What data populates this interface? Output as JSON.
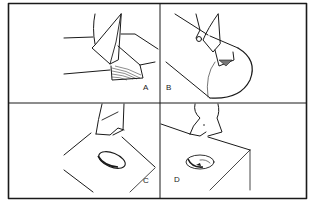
{
  "figure": {
    "panels": [
      {
        "id": "A",
        "label": "A",
        "subject": "drill bit cutting into edge of rectangular block, chip curl shown"
      },
      {
        "id": "B",
        "label": "B",
        "subject": "drill bit cutting into cylindrical rod"
      },
      {
        "id": "C",
        "label": "C",
        "subject": "drill bit above block with oval hole on top face"
      },
      {
        "id": "D",
        "label": "D",
        "subject": "drill bit above block with round countersunk hole"
      }
    ]
  },
  "colors": {
    "line": "#1a1a1a",
    "background": "#ffffff"
  }
}
